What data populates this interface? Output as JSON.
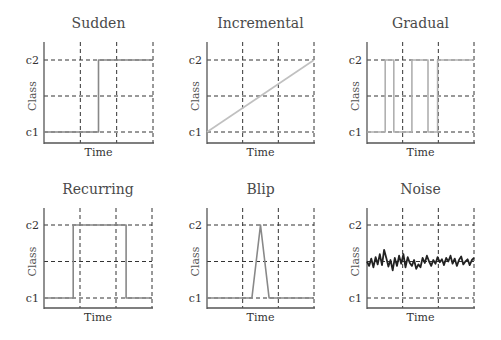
{
  "figure": {
    "style": {
      "axis_color": "#555555",
      "grid_color": "#333333",
      "line_color_gray": "#a8a8a8",
      "line_color_mid": "#888888",
      "line_color_dark": "#222222"
    }
  },
  "chart_data": [
    {
      "type": "line",
      "title": "Sudden",
      "xlabel": "Time",
      "ylabel": "Class",
      "yticks": [
        "c1",
        "c2"
      ],
      "grid": true,
      "x": [
        0,
        0.5,
        0.5,
        1.0
      ],
      "values": [
        0,
        0,
        1,
        1
      ],
      "color": "#888888"
    },
    {
      "type": "line",
      "title": "Incremental",
      "xlabel": "Time",
      "ylabel": "Class",
      "yticks": [
        "c1",
        "c2"
      ],
      "grid": true,
      "x": [
        0,
        1.0
      ],
      "values": [
        0,
        1
      ],
      "color": "#c0c0c0"
    },
    {
      "type": "line",
      "title": "Gradual",
      "xlabel": "Time",
      "ylabel": "Class",
      "yticks": [
        "c1",
        "c2"
      ],
      "grid": true,
      "x": [
        0,
        0.17,
        0.17,
        0.25,
        0.25,
        0.42,
        0.42,
        0.57,
        0.57,
        0.66,
        0.66,
        1.0
      ],
      "values": [
        0,
        0,
        1,
        1,
        0,
        0,
        1,
        1,
        0,
        0,
        1,
        1
      ],
      "color": "#b0b0b0"
    },
    {
      "type": "line",
      "title": "Recurring",
      "xlabel": "Time",
      "ylabel": "Class",
      "yticks": [
        "c1",
        "c2"
      ],
      "grid": true,
      "x": [
        0,
        0.27,
        0.27,
        0.76,
        0.76,
        1.0
      ],
      "values": [
        0,
        0,
        1,
        1,
        0,
        0
      ],
      "color": "#888888"
    },
    {
      "type": "line",
      "title": "Blip",
      "xlabel": "Time",
      "ylabel": "Class",
      "yticks": [
        "c1",
        "c2"
      ],
      "grid": true,
      "x": [
        0,
        0.42,
        0.5,
        0.58,
        1.0
      ],
      "values": [
        0,
        0,
        1,
        0,
        0
      ],
      "color": "#888888"
    },
    {
      "type": "line",
      "title": "Noise",
      "xlabel": "Time",
      "ylabel": "Class",
      "yticks": [
        "c1",
        "c2"
      ],
      "grid": true,
      "x": [
        0,
        0.02,
        0.04,
        0.06,
        0.08,
        0.1,
        0.12,
        0.14,
        0.16,
        0.18,
        0.2,
        0.22,
        0.24,
        0.26,
        0.28,
        0.3,
        0.32,
        0.34,
        0.36,
        0.38,
        0.4,
        0.42,
        0.44,
        0.46,
        0.48,
        0.5,
        0.52,
        0.54,
        0.56,
        0.58,
        0.6,
        0.62,
        0.64,
        0.66,
        0.68,
        0.7,
        0.72,
        0.74,
        0.76,
        0.78,
        0.8,
        0.82,
        0.84,
        0.86,
        0.88,
        0.9,
        0.92,
        0.94,
        0.96,
        0.98,
        1.0
      ],
      "values": [
        0.5,
        0.44,
        0.54,
        0.42,
        0.56,
        0.46,
        0.6,
        0.45,
        0.66,
        0.55,
        0.43,
        0.52,
        0.38,
        0.55,
        0.44,
        0.58,
        0.47,
        0.6,
        0.42,
        0.56,
        0.48,
        0.44,
        0.52,
        0.4,
        0.46,
        0.42,
        0.55,
        0.48,
        0.58,
        0.5,
        0.44,
        0.52,
        0.47,
        0.56,
        0.49,
        0.53,
        0.45,
        0.55,
        0.5,
        0.58,
        0.47,
        0.54,
        0.44,
        0.52,
        0.57,
        0.46,
        0.5,
        0.53,
        0.45,
        0.52,
        0.55
      ],
      "color": "#222222"
    }
  ]
}
